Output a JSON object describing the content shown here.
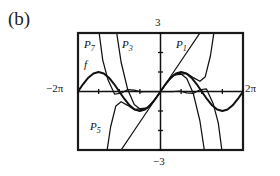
{
  "figure": {
    "part_label": "(b)",
    "frame": {
      "left": 78,
      "top": 33,
      "right": 243,
      "bottom": 150
    },
    "axis_labels": {
      "top": "3",
      "bottom": "−3",
      "left": "−2π",
      "right": "2π"
    },
    "curve_labels": [
      {
        "id": "P7",
        "base": "P",
        "sub": "7",
        "x": 84,
        "y": 38
      },
      {
        "id": "P3",
        "base": "P",
        "sub": "3",
        "x": 122,
        "y": 38
      },
      {
        "id": "P1",
        "base": "P",
        "sub": "1",
        "x": 176,
        "y": 38
      },
      {
        "id": "P5",
        "base": "P",
        "sub": "5",
        "x": 90,
        "y": 120
      },
      {
        "id": "f",
        "base": "f",
        "sub": "",
        "x": 84,
        "y": 58
      }
    ],
    "colors": {
      "ink": "#111111",
      "frame": "#1a1a1a",
      "background": "#ffffff"
    }
  },
  "chart_data": {
    "type": "line",
    "title": "",
    "subtitle": "",
    "xlabel": "",
    "ylabel": "",
    "xlim": [
      -6.283185307,
      6.283185307
    ],
    "ylim": [
      -3,
      3
    ],
    "xtick_labels": [
      "−2π",
      "2π"
    ],
    "ytick_labels": [
      "3",
      "−3"
    ],
    "grid": false,
    "legend": "inline-annotations",
    "axes": {
      "x_axis_at_y": 0,
      "y_axis_at_x": 0,
      "tick_spacing_x": 1.5707963,
      "tick_spacing_y": 1
    },
    "series": [
      {
        "name": "f",
        "expression": "sin(x)",
        "style": "solid-thick",
        "x": [
          -6.283185,
          -5.890486,
          -5.497787,
          -5.105088,
          -4.712389,
          -4.31969,
          -3.926991,
          -3.534292,
          -3.141593,
          -2.748894,
          -2.356194,
          -1.963495,
          -1.570796,
          -1.178097,
          -0.785398,
          -0.392699,
          0.0,
          0.392699,
          0.785398,
          1.178097,
          1.570796,
          1.963495,
          2.356194,
          2.748894,
          3.141593,
          3.534292,
          3.926991,
          4.31969,
          4.712389,
          5.105088,
          5.497787,
          5.890486,
          6.283185
        ],
        "y": [
          0.0,
          0.38268,
          0.70711,
          0.92388,
          1.0,
          0.92388,
          0.70711,
          0.38268,
          0.0,
          -0.38268,
          -0.70711,
          -0.92388,
          -1.0,
          -0.92388,
          -0.70711,
          -0.38268,
          0.0,
          0.38268,
          0.70711,
          0.92388,
          1.0,
          0.92388,
          0.70711,
          0.38268,
          0.0,
          -0.38268,
          -0.70711,
          -0.92388,
          -1.0,
          -0.92388,
          -0.70711,
          -0.38268,
          0.0
        ]
      },
      {
        "name": "P1",
        "expression": "x",
        "style": "solid-thin",
        "x": [
          -3.0,
          -2.0,
          -1.0,
          0.0,
          1.0,
          2.0,
          3.0
        ],
        "y": [
          -3.0,
          -2.0,
          -1.0,
          0.0,
          1.0,
          2.0,
          3.0
        ]
      },
      {
        "name": "P3",
        "expression": "x − x^3/3!",
        "style": "solid-thin",
        "x": [
          -3.6,
          -3.0,
          -2.5,
          -2.0,
          -1.5,
          -1.0,
          -0.5,
          0.0,
          0.5,
          1.0,
          1.5,
          2.0,
          2.5,
          3.0,
          3.6
        ],
        "y": [
          4.178,
          1.5,
          0.104,
          -0.667,
          -0.938,
          -0.833,
          -0.479,
          0.0,
          0.479,
          0.833,
          0.938,
          0.667,
          -0.104,
          -1.5,
          -4.178
        ]
      },
      {
        "name": "P5",
        "expression": "x − x^3/3! + x^5/5!",
        "style": "solid-thin",
        "x": [
          -4.2,
          -3.8,
          -3.4,
          -3.0,
          -2.5,
          -2.0,
          -1.5,
          -1.0,
          -0.5,
          0.0,
          0.5,
          1.0,
          1.5,
          2.0,
          2.5,
          3.0,
          3.4,
          3.8,
          4.2
        ],
        "y": [
          -3.61,
          -1.82,
          -0.74,
          -0.525,
          -0.71,
          -0.933,
          -0.875,
          -0.842,
          -0.479,
          0.0,
          0.479,
          0.842,
          0.875,
          0.933,
          0.71,
          0.525,
          0.74,
          1.82,
          3.61
        ]
      },
      {
        "name": "P7",
        "expression": "x − x^3/3! + x^5/5! − x^7/7!",
        "style": "solid-thin",
        "x": [
          -4.8,
          -4.4,
          -4.0,
          -3.5,
          -3.0,
          -2.5,
          -2.0,
          -1.5,
          -1.0,
          -0.5,
          0.0,
          0.5,
          1.0,
          1.5,
          2.0,
          2.5,
          3.0,
          3.5,
          4.0,
          4.4,
          4.8
        ],
        "y": [
          3.66,
          1.61,
          0.6,
          -0.13,
          -0.09,
          0.1,
          0.07,
          -0.02,
          0.0,
          0.0,
          0.0,
          0.0,
          0.0,
          0.02,
          -0.07,
          -0.1,
          0.09,
          0.13,
          -0.6,
          -1.61,
          -3.66
        ]
      }
    ]
  }
}
